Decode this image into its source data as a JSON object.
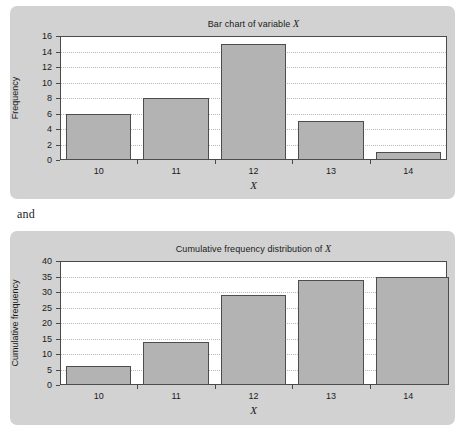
{
  "between_text": "and",
  "colors": {
    "card_background": "#d2d2d2",
    "plot_background": "#ffffff",
    "bar_fill": "#b3b3b3",
    "bar_border": "#4d4d4d",
    "axis": "#4a4a4a",
    "gridline": "#b9b9b9",
    "text": "#1a1a1a"
  },
  "chart_data": [
    {
      "type": "bar",
      "title": "Bar chart of variable X",
      "title_prefix": "Bar chart of variable ",
      "title_italic": "X",
      "xlabel": "X",
      "ylabel": "Frequency",
      "categories": [
        "10",
        "11",
        "12",
        "13",
        "14"
      ],
      "values": [
        6,
        8,
        15,
        5,
        1
      ],
      "ylim": [
        0,
        16
      ],
      "yticks": [
        0,
        2,
        4,
        6,
        8,
        10,
        12,
        14,
        16
      ],
      "ytick_labels": [
        "0",
        "2",
        "4",
        "6",
        "8",
        "10",
        "12",
        "14",
        "16"
      ],
      "grid": true,
      "legend": "none"
    },
    {
      "type": "bar",
      "title": "Cumulative frequency distribution of X",
      "title_prefix": "Cumulative frequency distribution of ",
      "title_italic": "X",
      "xlabel": "X",
      "ylabel": "Cumulative frequency",
      "categories": [
        "10",
        "11",
        "12",
        "13",
        "14"
      ],
      "values": [
        6,
        14,
        29,
        34,
        35
      ],
      "ylim": [
        0,
        40
      ],
      "yticks": [
        0,
        5,
        10,
        15,
        20,
        25,
        30,
        35,
        40
      ],
      "ytick_labels": [
        "0",
        "5",
        "10",
        "15",
        "20",
        "25",
        "30",
        "35",
        "40"
      ],
      "grid": true,
      "legend": "none"
    }
  ]
}
